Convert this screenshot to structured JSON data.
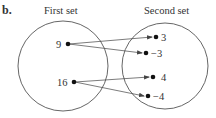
{
  "part_label": "b.",
  "sets": {
    "first": {
      "title": "First set",
      "elements": [
        "9",
        "16"
      ]
    },
    "second": {
      "title": "Second set",
      "elements": [
        "3",
        "−3",
        "4",
        "−4"
      ]
    }
  },
  "mappings": [
    {
      "from": "9",
      "to": "3"
    },
    {
      "from": "9",
      "to": "−3"
    },
    {
      "from": "16",
      "to": "4"
    },
    {
      "from": "16",
      "to": "−4"
    }
  ],
  "colors": {
    "stroke": "#555555",
    "dot": "#111111",
    "text": "#333333"
  }
}
